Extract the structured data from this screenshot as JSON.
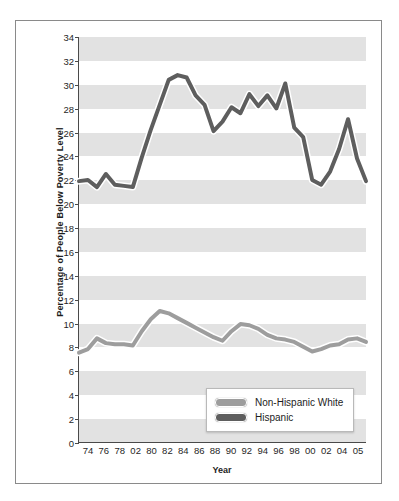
{
  "chart_data": {
    "type": "line",
    "title": "",
    "xlabel": "Year",
    "ylabel": "Percentage of People Below Poverty Level",
    "ylim": [
      0,
      34
    ],
    "ytick_step": 2,
    "yticks": [
      0,
      2,
      4,
      6,
      8,
      10,
      12,
      14,
      16,
      18,
      20,
      22,
      24,
      26,
      28,
      30,
      32,
      34
    ],
    "grid": "horizontal-bands",
    "legend_position": "inside-bottom-center",
    "xtick_labels": [
      "74",
      "76",
      "78",
      "02",
      "80",
      "82",
      "84",
      "86",
      "88",
      "90",
      "92",
      "94",
      "96",
      "98",
      "00",
      "02",
      "04",
      "05"
    ],
    "x": [
      1973,
      1974,
      1975,
      1976,
      1977,
      1978,
      1979,
      1980,
      1981,
      1982,
      1983,
      1984,
      1985,
      1986,
      1987,
      1988,
      1989,
      1990,
      1991,
      1992,
      1993,
      1994,
      1995,
      1996,
      1997,
      1998,
      1999,
      2000,
      2001,
      2002,
      2003,
      2004,
      2005
    ],
    "series": [
      {
        "name": "Hispanic",
        "color": "#5e5e5e",
        "values": [
          21.9,
          22.0,
          21.4,
          22.5,
          21.6,
          21.5,
          21.4,
          23.9,
          26.2,
          28.3,
          30.4,
          30.8,
          30.6,
          29.1,
          28.3,
          26.1,
          26.9,
          28.1,
          27.6,
          29.2,
          28.2,
          29.1,
          28.0,
          30.1,
          26.4,
          25.6,
          22.0,
          21.6,
          22.7,
          24.6,
          27.1,
          23.8,
          21.9
        ]
      },
      {
        "name": "Non-Hispanic White",
        "color": "#9d9d9d",
        "values": [
          7.5,
          7.8,
          8.7,
          8.3,
          8.2,
          8.2,
          8.1,
          9.3,
          10.3,
          11.0,
          10.8,
          10.4,
          10.0,
          9.6,
          9.2,
          8.8,
          8.5,
          9.3,
          9.9,
          9.8,
          9.5,
          9.0,
          8.7,
          8.6,
          8.4,
          8.0,
          7.6,
          7.8,
          8.1,
          8.2,
          8.6,
          8.7,
          8.4
        ]
      }
    ]
  },
  "legend": {
    "items": [
      {
        "label": "Non-Hispanic White",
        "color": "#9d9d9d"
      },
      {
        "label": "Hispanic",
        "color": "#5e5e5e"
      }
    ]
  },
  "axes": {
    "y_title": "Percentage of People Below Poverty Level",
    "x_title": "Year"
  }
}
